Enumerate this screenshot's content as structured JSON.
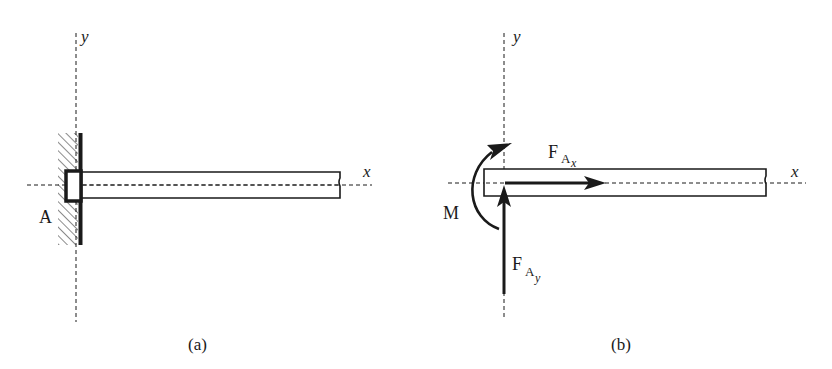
{
  "figure": {
    "panels": [
      {
        "id": "a",
        "caption": "(a)",
        "axis_x_label": "x",
        "axis_y_label": "y",
        "support_label": "A",
        "description": "Cantilever beam fixed at wall support A"
      },
      {
        "id": "b",
        "caption": "(b)",
        "axis_x_label": "x",
        "axis_y_label": "y",
        "moment_label": "M",
        "force_x_label": "F",
        "force_x_sub": "A",
        "force_x_subsub": "x",
        "force_y_label": "F",
        "force_y_sub": "A",
        "force_y_subsub": "y",
        "description": "Free-body diagram with reaction forces and moment at A"
      }
    ],
    "colors": {
      "ink": "#1a1a1a",
      "background": "#ffffff"
    }
  }
}
